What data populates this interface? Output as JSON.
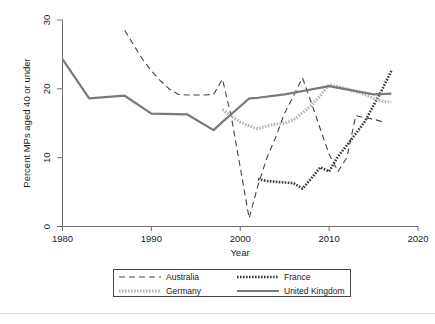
{
  "chart_data": {
    "type": "line",
    "title": "",
    "subtitle": "",
    "xlabel": "Year",
    "ylabel": "Percent MPs aged 40 or under",
    "xlim": [
      1980,
      2020
    ],
    "ylim": [
      0,
      30
    ],
    "xticks": [
      1980,
      1990,
      2000,
      2010,
      2020
    ],
    "yticks": [
      0,
      10,
      20,
      30
    ],
    "grid": false,
    "legend_position": "below-axes",
    "series": [
      {
        "name": "Australia",
        "style": "dashed",
        "color": "#444444",
        "x": [
          1987,
          1988,
          1989,
          1990,
          1991,
          1992,
          1993,
          1994,
          1995,
          1996,
          1997,
          1998,
          1999,
          2000,
          2001,
          2002,
          2003,
          2004,
          2005,
          2006,
          2007,
          2008,
          2009,
          2010,
          2011,
          2012,
          2013,
          2014,
          2015,
          2016
        ],
        "y": [
          28.5,
          26.4,
          24.3,
          22.6,
          21.2,
          20.0,
          19.2,
          19.1,
          19.1,
          19.1,
          19.2,
          21.4,
          15.9,
          8.6,
          1.2,
          6.0,
          10.0,
          13.0,
          16.5,
          19.0,
          21.6,
          18.0,
          14.2,
          10.5,
          8.0,
          10.0,
          16.1,
          15.8,
          15.6,
          15.2
        ]
      },
      {
        "name": "France",
        "style": "dotted",
        "color": "#3a3a3a",
        "x": [
          2002,
          2003,
          2004,
          2005,
          2006,
          2007,
          2008,
          2009,
          2010,
          2011,
          2012,
          2013,
          2014,
          2015,
          2016,
          2017
        ],
        "y": [
          6.9,
          6.6,
          6.5,
          6.4,
          6.3,
          5.5,
          7.0,
          8.6,
          8.0,
          10.2,
          11.8,
          13.5,
          15.2,
          17.6,
          20.0,
          22.6
        ]
      },
      {
        "name": "Germany",
        "style": "dotted-light",
        "color": "#b3b3b3",
        "x": [
          1998,
          1999,
          2000,
          2001,
          2002,
          2003,
          2004,
          2005,
          2006,
          2007,
          2008,
          2009,
          2010,
          2011,
          2012,
          2013,
          2014,
          2015,
          2016,
          2017
        ],
        "y": [
          17.0,
          16.0,
          15.2,
          14.6,
          14.2,
          14.6,
          14.9,
          15.0,
          15.5,
          16.5,
          17.6,
          19.0,
          20.6,
          20.3,
          20.0,
          19.6,
          19.2,
          18.6,
          18.2,
          18.1
        ]
      },
      {
        "name": "United Kingdom",
        "style": "solid",
        "color": "#7a7a7a",
        "x": [
          1980,
          1983,
          1987,
          1990,
          1994,
          1997,
          1998,
          2001,
          2002,
          2005,
          2010,
          2015,
          2017
        ],
        "y": [
          24.3,
          18.6,
          19.0,
          16.4,
          16.3,
          14.0,
          15.2,
          18.6,
          18.7,
          19.2,
          20.4,
          19.2,
          19.3
        ]
      }
    ]
  },
  "axes": {
    "ylabel": "Percent MPs aged 40 or under",
    "xlabel": "Year",
    "ytick_labels": [
      "0",
      "10",
      "20",
      "30"
    ],
    "xtick_labels": [
      "1980",
      "1990",
      "2000",
      "2010",
      "2020"
    ]
  },
  "legend": {
    "entries": [
      {
        "label": "Australia",
        "style": "dashed",
        "color": "#444444"
      },
      {
        "label": "France",
        "style": "dotted",
        "color": "#3a3a3a"
      },
      {
        "label": "Germany",
        "style": "dotted-light",
        "color": "#b3b3b3"
      },
      {
        "label": "United Kingdom",
        "style": "solid",
        "color": "#7a7a7a"
      }
    ]
  }
}
